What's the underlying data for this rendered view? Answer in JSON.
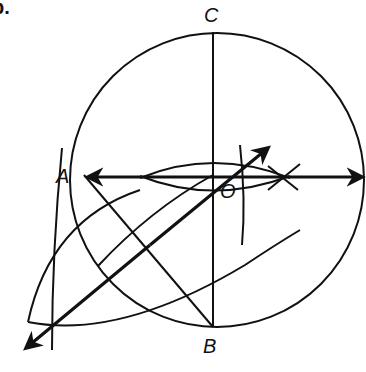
{
  "problem_number": "b.",
  "labels": {
    "A": "A",
    "B": "B",
    "C": "C",
    "O": "O"
  },
  "figure": {
    "circle": {
      "cx": 215,
      "cy": 180,
      "r": 147
    },
    "points": {
      "A": [
        82,
        177
      ],
      "B": [
        213,
        327
      ],
      "C": [
        213,
        32
      ],
      "O": [
        213,
        177
      ]
    }
  }
}
